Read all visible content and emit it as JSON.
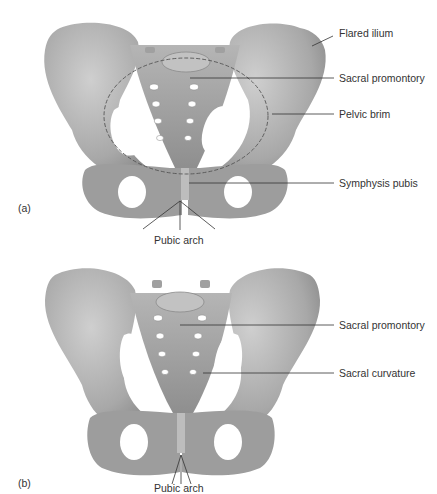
{
  "figure": {
    "type": "anatomical-diagram",
    "colors": {
      "bone_light": "#c8c8c8",
      "bone_mid": "#a9a9a9",
      "bone_dark": "#7e7e7e",
      "leader_line": "#333333",
      "text": "#333333",
      "background": "#ffffff"
    }
  },
  "panels": [
    {
      "id": "a",
      "letter": "(a)",
      "labels": [
        {
          "text": "Flared ilium"
        },
        {
          "text": "Sacral promontory"
        },
        {
          "text": "Pelvic brim"
        },
        {
          "text": "Symphysis pubis"
        },
        {
          "text": "Pubic arch"
        }
      ]
    },
    {
      "id": "b",
      "letter": "(b)",
      "labels": [
        {
          "text": "Sacral promontory"
        },
        {
          "text": "Sacral curvature"
        },
        {
          "text": "Pubic arch"
        }
      ]
    }
  ]
}
